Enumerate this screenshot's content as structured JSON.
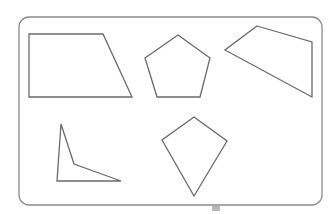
{
  "diagram": {
    "frame": {
      "x": 19,
      "y": 17,
      "width": 303,
      "height": 188,
      "radius": 10
    },
    "stroke_color": "#6a6a6a",
    "shapes": [
      {
        "name": "trapezoid",
        "points": "29,34 103,34 132,97 29,97"
      },
      {
        "name": "pentagon",
        "points": "178,35 210,58 200,97 157,97 145,58"
      },
      {
        "name": "irregular-quadrilateral",
        "points": "257,26 312,42 312,97 225,50"
      },
      {
        "name": "concave-quadrilateral",
        "points": "61,124 74,164 121,181 57,181"
      },
      {
        "name": "kite",
        "points": "194,117 227,141 194,196 162,140"
      }
    ]
  }
}
